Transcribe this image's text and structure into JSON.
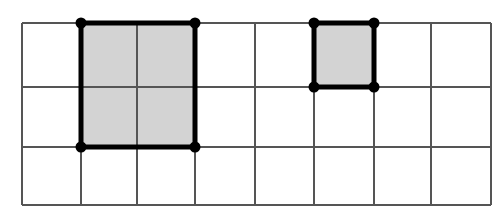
{
  "diagram": {
    "type": "grid-with-shaded-rectangles",
    "grid": {
      "columns": 8,
      "rows": 3,
      "x_lines": [
        22,
        81,
        137,
        195,
        255,
        314,
        374,
        431,
        491
      ],
      "y_lines": [
        23,
        87,
        147,
        205
      ],
      "line_color": "#555555",
      "background": "#ffffff"
    },
    "shapes": [
      {
        "name": "large-rectangle",
        "col_start": 1,
        "col_end": 3,
        "row_start": 0,
        "row_end": 2,
        "width_units": 2,
        "height_units": 2,
        "fill": "#d3d3d3",
        "stroke": "#000000",
        "vertices": 4
      },
      {
        "name": "small-square",
        "col_start": 5,
        "col_end": 6,
        "row_start": 0,
        "row_end": 1,
        "width_units": 1,
        "height_units": 1,
        "fill": "#d3d3d3",
        "stroke": "#000000",
        "vertices": 4
      }
    ]
  }
}
